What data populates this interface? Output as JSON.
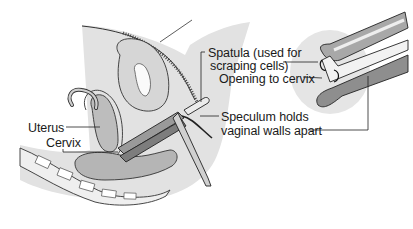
{
  "diagram": {
    "title": "",
    "style": "grayscale anatomical line illustration",
    "colors": {
      "background": "#ffffff",
      "skin_shade": "#d4d4d4",
      "tissue_light": "#e6e6e6",
      "tissue_mid": "#b8b8b8",
      "tissue_dark": "#8c8c8c",
      "line": "#1a1a1a"
    },
    "labels": {
      "spatula_line1": "Spatula (used for",
      "spatula_line2": "scraping cells)",
      "opening": "Opening to cervix",
      "speculum_line1": "Speculum holds",
      "speculum_line2": "vaginal walls apart",
      "uterus": "Uterus",
      "cervix": "Cervix"
    },
    "panels": [
      {
        "name": "sagittal-section",
        "description": "side cross-section of pelvis with speculum inserted"
      },
      {
        "name": "inset-closeup",
        "description": "close-up of speculum blades and spatula at cervical opening"
      }
    ]
  }
}
